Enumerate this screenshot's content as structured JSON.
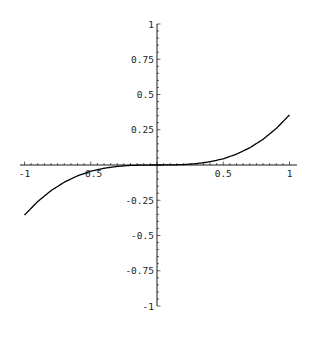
{
  "chart_data": {
    "type": "line",
    "title": "",
    "xlabel": "",
    "ylabel": "",
    "xlim": [
      -1,
      1
    ],
    "ylim": [
      -1,
      1
    ],
    "grid": false,
    "legend": null,
    "x_ticks": [
      -1,
      -0.5,
      0.5,
      1
    ],
    "x_tick_labels": [
      "-1",
      "-0.5",
      "0.5",
      "1"
    ],
    "y_ticks": [
      1,
      0.75,
      0.5,
      0.25,
      -0.25,
      -0.5,
      -0.75,
      -1
    ],
    "y_tick_labels": [
      "1",
      "0.75",
      "0.5",
      "0.25",
      "-0.25",
      "-0.5",
      "-0.75",
      "-1"
    ],
    "minor_ticks_per_interval": 4,
    "series": [
      {
        "name": "curve",
        "color": "#000000",
        "x": [
          -1,
          -0.9,
          -0.8,
          -0.7,
          -0.6,
          -0.5,
          -0.4,
          -0.3,
          -0.2,
          -0.1,
          0,
          0.1,
          0.2,
          0.3,
          0.4,
          0.5,
          0.6,
          0.7,
          0.8,
          0.9,
          1
        ],
        "y": [
          -0.355,
          -0.259,
          -0.182,
          -0.122,
          -0.077,
          -0.044,
          -0.023,
          -0.01,
          -0.003,
          -0.0004,
          0,
          0.0004,
          0.003,
          0.01,
          0.023,
          0.044,
          0.077,
          0.122,
          0.182,
          0.259,
          0.355
        ]
      }
    ]
  },
  "plot": {
    "axis_color": "#000000",
    "background": "#ffffff"
  }
}
